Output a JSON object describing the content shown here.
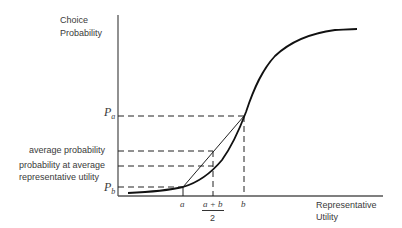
{
  "diagram": {
    "y_axis_label_line1": "Choice",
    "y_axis_label_line2": "Probability",
    "x_axis_label_line1": "Representative",
    "x_axis_label_line2": "Utility",
    "y_labels": {
      "pa": "P",
      "pa_sub": "a",
      "pb": "P",
      "pb_sub": "b",
      "average_probability": "average probability",
      "prob_avg_util_line1": "probability at average",
      "prob_avg_util_line2": "representative utility"
    },
    "x_labels": {
      "a": "a",
      "mid_numerator": "a + b",
      "mid_denominator": "2",
      "b": "b"
    },
    "colors": {
      "line": "#1a1a1a",
      "axis": "#555555",
      "text": "#3a3a3a"
    }
  }
}
